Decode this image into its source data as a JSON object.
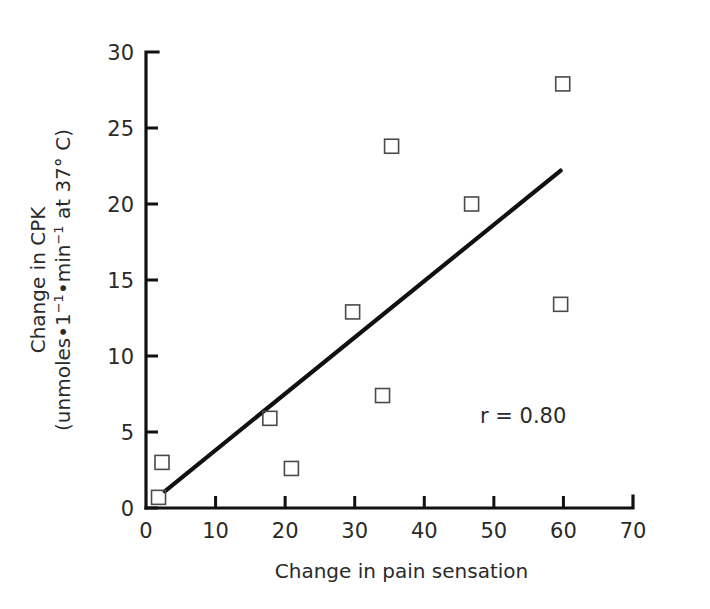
{
  "chart_data": {
    "type": "scatter",
    "title": "",
    "xlabel": "Change in pain sensation",
    "ylabel_line1": "Change in CPK",
    "ylabel_line2": "(unmoles•1⁻¹•min⁻¹ at 37° C)",
    "xlim": [
      0,
      70
    ],
    "ylim": [
      0,
      30
    ],
    "xticks": [
      0,
      10,
      20,
      30,
      40,
      50,
      60,
      70
    ],
    "yticks": [
      0,
      5,
      10,
      15,
      20,
      25,
      30
    ],
    "xtick_labels": [
      "0",
      "10",
      "20",
      "30",
      "40",
      "50",
      "60",
      "70"
    ],
    "ytick_labels": [
      "0",
      "5",
      "10",
      "15",
      "20",
      "25",
      "30"
    ],
    "grid": false,
    "legend": false,
    "marker_style": "open-square",
    "points": [
      {
        "x": 1.8,
        "y": 0.7
      },
      {
        "x": 2.3,
        "y": 3.0
      },
      {
        "x": 17.8,
        "y": 5.9
      },
      {
        "x": 20.9,
        "y": 2.6
      },
      {
        "x": 29.7,
        "y": 12.9
      },
      {
        "x": 34.0,
        "y": 7.4
      },
      {
        "x": 35.3,
        "y": 23.8
      },
      {
        "x": 46.8,
        "y": 20.0
      },
      {
        "x": 59.6,
        "y": 13.4
      },
      {
        "x": 59.9,
        "y": 27.9
      }
    ],
    "fit_line": {
      "x_start": 2.7,
      "y_start": 1.1,
      "x_end": 59.6,
      "y_end": 22.2
    },
    "annotations": [
      {
        "text": "r = 0.80",
        "x": 48.0,
        "y": 5.6,
        "name": "correlation-annotation"
      }
    ],
    "correlation_label": "r = 0.80",
    "correlation_value": 0.8,
    "colors": {
      "axis": "#111111",
      "line": "#111111",
      "marker": "#4a4a4a",
      "text": "#2a2a2a",
      "background": "#ffffff"
    }
  }
}
